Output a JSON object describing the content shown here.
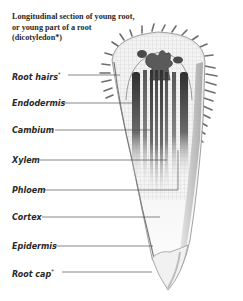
{
  "title": "Longitudinal section of young root, or young part of a root (dicotyledon*)",
  "labels": [
    {
      "text": "Root hairs",
      "mark": "*",
      "y": 71,
      "line_y": 75,
      "line_x1": 68,
      "line_x2": 120
    },
    {
      "text": "Endodermis",
      "mark": "",
      "y": 99,
      "line_y": 103,
      "line_x1": 62,
      "line_x2": 133
    },
    {
      "text": "Cambium",
      "mark": "",
      "y": 126,
      "line_y": 130,
      "line_x1": 55,
      "line_x2": 152
    },
    {
      "text": "Xylem",
      "mark": "",
      "y": 156,
      "line_y": 160,
      "line_x1": 40,
      "line_x2": 167
    },
    {
      "text": "Phloem",
      "mark": "",
      "y": 186,
      "line_y": 190,
      "line_x1": 45,
      "line_x2": 178
    },
    {
      "text": "Cortex",
      "mark": "",
      "y": 213,
      "line_y": 217,
      "line_x1": 42,
      "line_x2": 160
    },
    {
      "text": "Epidermis",
      "mark": "",
      "y": 242,
      "line_y": 246,
      "line_x1": 55,
      "line_x2": 153
    },
    {
      "text": "Root cap",
      "mark": "*",
      "y": 268,
      "line_y": 272,
      "line_x1": 62,
      "line_x2": 152
    }
  ],
  "colors": {
    "text": "#2a2a2a",
    "leader": "#555555",
    "vascular_dark": "#3a3a3a",
    "cell_grid": "#bdbdbd",
    "outline": "#7a7a7a"
  }
}
